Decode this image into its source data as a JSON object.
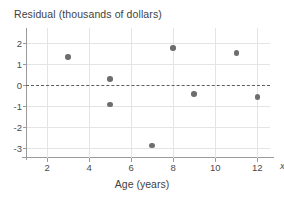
{
  "chart_data": {
    "type": "scatter",
    "title": "Residual (thousands of dollars)",
    "xlabel": "Age (years)",
    "ylabel": "Residual (thousands of dollars)",
    "x_axis_symbol": "x",
    "xlim": [
      1.0,
      12.6
    ],
    "ylim": [
      -3.5,
      2.5
    ],
    "xticks": [
      2,
      4,
      6,
      8,
      10,
      12
    ],
    "xtick_labels": [
      "2",
      "4",
      "6",
      "8",
      "10",
      "12"
    ],
    "yticks": [
      2,
      1,
      0,
      -1,
      -2,
      -3
    ],
    "ytick_labels": [
      "2",
      "1",
      "0",
      "-1",
      "-2",
      "-3"
    ],
    "grid": true,
    "legend": "none",
    "reference_line": {
      "y": 0,
      "style": "dashed",
      "color": "#5e5e5e"
    },
    "point_color": "#6e6e6e",
    "grid_color": "#e4e4e4",
    "axis_color": "#9a9a9a",
    "points": [
      {
        "x": 3,
        "y": 1.3
      },
      {
        "x": 5,
        "y": 0.25
      },
      {
        "x": 5,
        "y": -0.95
      },
      {
        "x": 7,
        "y": -2.9
      },
      {
        "x": 8,
        "y": 1.75
      },
      {
        "x": 9,
        "y": -0.45
      },
      {
        "x": 11,
        "y": 1.5
      },
      {
        "x": 12,
        "y": -0.6
      }
    ]
  }
}
